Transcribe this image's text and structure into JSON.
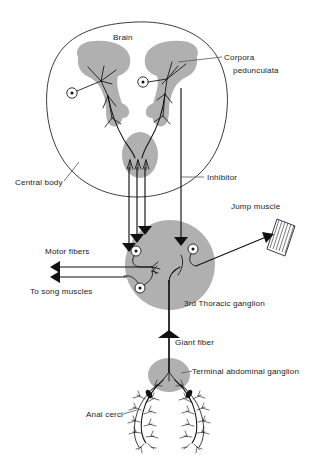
{
  "figure": {
    "colors": {
      "ink": "#111111",
      "gray_tissue": "#b0b0b0",
      "leader": "#555555",
      "background": "#ffffff"
    }
  },
  "labels": {
    "brain": "Brain",
    "corpora_pedunculata_line1": "Corpora",
    "corpora_pedunculata_line2": "pedunculata",
    "central_body": "Central body",
    "inhibitor": "Inhibitor",
    "jump_muscle": "Jump muscle",
    "motor_fibers": "Motor fibers",
    "to_song_muscles": "To song muscles",
    "third_thoracic_ganglion": "3rd Thoracic ganglion",
    "giant_fiber": "Giant fiber",
    "terminal_abdominal_ganglion": "Terminal abdominal ganglion",
    "anal_cerci": "Anal cerci"
  },
  "structures": [
    {
      "name": "brain",
      "type": "outline",
      "shape": "rounded-triangle"
    },
    {
      "name": "corpora-pedunculata-left",
      "type": "gray-mass"
    },
    {
      "name": "corpora-pedunculata-right",
      "type": "gray-mass"
    },
    {
      "name": "central-body",
      "type": "gray-mass"
    },
    {
      "name": "third-thoracic-ganglion",
      "type": "gray-mass"
    },
    {
      "name": "terminal-abdominal-ganglion",
      "type": "gray-mass"
    },
    {
      "name": "jump-muscle",
      "type": "striated-bundle"
    },
    {
      "name": "anal-cercus-left",
      "type": "bristled-appendage"
    },
    {
      "name": "anal-cercus-right",
      "type": "bristled-appendage"
    }
  ],
  "neurons": [
    {
      "name": "brain-neuron-left",
      "soma": "circle-with-nucleus"
    },
    {
      "name": "brain-neuron-right",
      "soma": "circle-with-nucleus"
    },
    {
      "name": "thoracic-motor-neuron-upper",
      "soma": "circle-with-nucleus"
    },
    {
      "name": "thoracic-motor-neuron-lower",
      "soma": "circle-with-nucleus"
    },
    {
      "name": "thoracic-jump-neuron",
      "soma": "circle-with-nucleus"
    }
  ],
  "pathways": [
    {
      "name": "descending-fiber-tract",
      "count": 3,
      "direction": "brain-to-thoracic-ganglion"
    },
    {
      "name": "inhibitor-fiber",
      "direction": "brain-to-thoracic-ganglion"
    },
    {
      "name": "giant-fiber",
      "direction": "terminal-abdominal-to-thoracic-ganglion"
    },
    {
      "name": "motor-output-song",
      "count": 2,
      "direction": "leftward"
    },
    {
      "name": "motor-output-jump",
      "count": 1,
      "direction": "rightward"
    }
  ]
}
